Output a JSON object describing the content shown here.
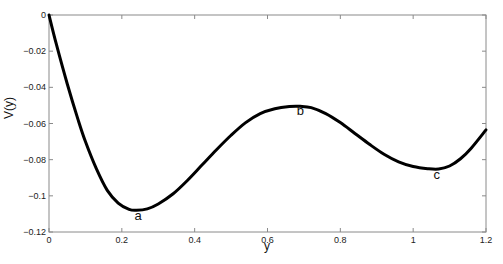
{
  "chart_data": {
    "type": "line",
    "title": "",
    "xlabel": "y",
    "ylabel": "V(y)",
    "xlim": [
      0,
      1.2
    ],
    "ylim": [
      -0.12,
      0
    ],
    "grid": false,
    "legend": "none",
    "xticks": [
      0,
      0.2,
      0.4,
      0.6,
      0.8,
      1,
      1.2
    ],
    "xtick_labels": [
      "0",
      "0.2",
      "0.4",
      "0.6",
      "0.8",
      "1",
      "1.2"
    ],
    "yticks": [
      0,
      -0.02,
      -0.04,
      -0.06,
      -0.08,
      -0.1,
      -0.12
    ],
    "ytick_labels": [
      "0",
      "-0.02",
      "-0.04",
      "-0.06",
      "-0.08",
      "-0.1",
      "-0.12"
    ],
    "series": [
      {
        "name": "V(y)",
        "color": "#000000",
        "x": [
          0,
          0.02,
          0.05,
          0.08,
          0.1,
          0.13,
          0.16,
          0.19,
          0.22,
          0.24,
          0.27,
          0.3,
          0.34,
          0.38,
          0.42,
          0.46,
          0.5,
          0.54,
          0.58,
          0.62,
          0.66,
          0.69,
          0.72,
          0.76,
          0.8,
          0.84,
          0.88,
          0.92,
          0.96,
          1.0,
          1.04,
          1.07,
          1.1,
          1.13,
          1.16,
          1.2
        ],
        "y": [
          0,
          -0.016,
          -0.038,
          -0.058,
          -0.07,
          -0.085,
          -0.097,
          -0.104,
          -0.1075,
          -0.108,
          -0.1072,
          -0.1045,
          -0.099,
          -0.0915,
          -0.083,
          -0.0745,
          -0.0665,
          -0.0595,
          -0.0545,
          -0.0518,
          -0.0506,
          -0.0505,
          -0.0512,
          -0.0545,
          -0.0595,
          -0.0655,
          -0.0715,
          -0.077,
          -0.0812,
          -0.0838,
          -0.085,
          -0.0852,
          -0.0835,
          -0.0795,
          -0.0735,
          -0.0635
        ]
      }
    ],
    "annotations": [
      {
        "text": "a",
        "x": 0.245,
        "y": -0.1135
      },
      {
        "text": "b",
        "x": 0.69,
        "y": -0.0555
      },
      {
        "text": "c",
        "x": 1.065,
        "y": -0.0905
      }
    ]
  }
}
